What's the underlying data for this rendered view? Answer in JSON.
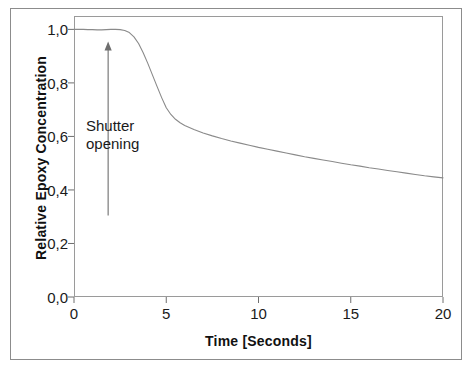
{
  "chart_data": {
    "type": "line",
    "title": "",
    "xlabel": "Time [Seconds]",
    "ylabel": "Relative Epoxy Concentration",
    "xlim": [
      0,
      20
    ],
    "ylim": [
      0.0,
      1.05
    ],
    "grid": false,
    "legend": null,
    "xticks": [
      0,
      5,
      10,
      15,
      20
    ],
    "xtick_labels": [
      "0",
      "5",
      "10",
      "15",
      "20"
    ],
    "yticks": [
      0.0,
      0.2,
      0.4,
      0.6,
      0.8,
      1.0
    ],
    "ytick_labels": [
      "0,0",
      "0,2",
      "0,4",
      "0,6",
      "0,8",
      "1,0"
    ],
    "line_color": "#8a8a8a",
    "annotations": [
      {
        "text": "Shutter\nopening",
        "x": 1.85,
        "y": 0.24,
        "arrow_from_x": 1.85,
        "arrow_from_y": 0.305,
        "arrow_to_x": 1.85,
        "arrow_to_y": 0.955
      }
    ],
    "series": [
      {
        "name": "Relative Epoxy Concentration",
        "x": [
          0.0,
          0.25,
          0.5,
          0.75,
          1.0,
          1.25,
          1.5,
          1.75,
          2.0,
          2.25,
          2.5,
          2.75,
          3.0,
          3.25,
          3.5,
          3.75,
          4.0,
          4.25,
          4.5,
          4.75,
          5.0,
          5.25,
          5.5,
          5.75,
          6.0,
          6.5,
          7.0,
          7.5,
          8.0,
          8.5,
          9.0,
          9.5,
          10.0,
          10.5,
          11.0,
          11.5,
          12.0,
          12.5,
          13.0,
          13.5,
          14.0,
          14.5,
          15.0,
          15.5,
          16.0,
          16.5,
          17.0,
          17.5,
          18.0,
          18.5,
          19.0,
          19.5,
          20.0
        ],
        "y": [
          1.0,
          1.0,
          1.0,
          0.999,
          0.999,
          0.998,
          0.998,
          0.999,
          1.0,
          1.0,
          0.999,
          0.996,
          0.988,
          0.972,
          0.947,
          0.913,
          0.873,
          0.83,
          0.787,
          0.745,
          0.707,
          0.682,
          0.664,
          0.651,
          0.641,
          0.626,
          0.613,
          0.602,
          0.592,
          0.583,
          0.575,
          0.567,
          0.559,
          0.552,
          0.545,
          0.538,
          0.531,
          0.524,
          0.518,
          0.512,
          0.506,
          0.5,
          0.494,
          0.489,
          0.483,
          0.478,
          0.473,
          0.468,
          0.463,
          0.458,
          0.453,
          0.449,
          0.445
        ]
      }
    ]
  }
}
